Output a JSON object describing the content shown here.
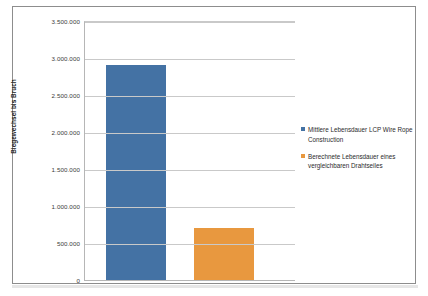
{
  "chart_data": {
    "type": "bar",
    "title": "",
    "xlabel": "",
    "ylabel": "Biegewechsel bis Bruch",
    "ylim": [
      0,
      3500000
    ],
    "ytick_labels": [
      "3.500.000",
      "3.000.000",
      "2.500.000",
      "2.000.000",
      "1.500.000",
      "1.000.000",
      "500.000",
      "0"
    ],
    "ytick_values": [
      3500000,
      3000000,
      2500000,
      2000000,
      1500000,
      1000000,
      500000,
      0
    ],
    "grid": true,
    "legend_position": "right",
    "categories": [
      "Mittlere Lebensdauer LCP Wire Rope Construction",
      "Berechnete Lebensdauer eines vergleichbaren Drahtseiles"
    ],
    "values": [
      2900000,
      700000
    ],
    "series": [
      {
        "name": "Mittlere Lebensdauer LCP Wire Rope Construction",
        "value": 2900000,
        "color": "#4472a4"
      },
      {
        "name": "Berechnete Lebensdauer eines vergleichbaren Drahtseiles",
        "value": 700000,
        "color": "#e8983f"
      }
    ]
  },
  "legend": {
    "entries": [
      {
        "label": "Mittlere Lebensdauer LCP Wire Rope Construction",
        "color": "#4472a4"
      },
      {
        "label": "Berechnete Lebensdauer eines vergleichbaren Drahtseiles",
        "color": "#e8983f"
      }
    ]
  },
  "colors": {
    "series_blue": "#4472a4",
    "series_orange": "#e8983f",
    "gridline": "#c9c9c9",
    "axis": "#b6b6b6",
    "frame": "#8d8d8d"
  }
}
